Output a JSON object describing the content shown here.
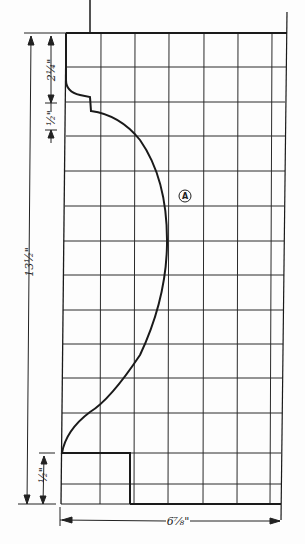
{
  "drawing": {
    "type": "molding-profile-grid",
    "callout": "A",
    "dimensions": {
      "top_section": "2¼\"",
      "upper_step": "½\"",
      "overall_height": "13½\"",
      "bottom_step": "½\"",
      "overall_width": "6⅞\""
    },
    "grid": {
      "columns_x": [
        66,
        101,
        135,
        169,
        204,
        238,
        272,
        285
      ],
      "rows_y": [
        33,
        67,
        102,
        136,
        171,
        206,
        241,
        275,
        310,
        344,
        378,
        413,
        453,
        484,
        504
      ]
    },
    "colors": {
      "ink": "#1a1a1a",
      "grid": "#2a2a2a",
      "paper": "#fdfdfd"
    }
  }
}
